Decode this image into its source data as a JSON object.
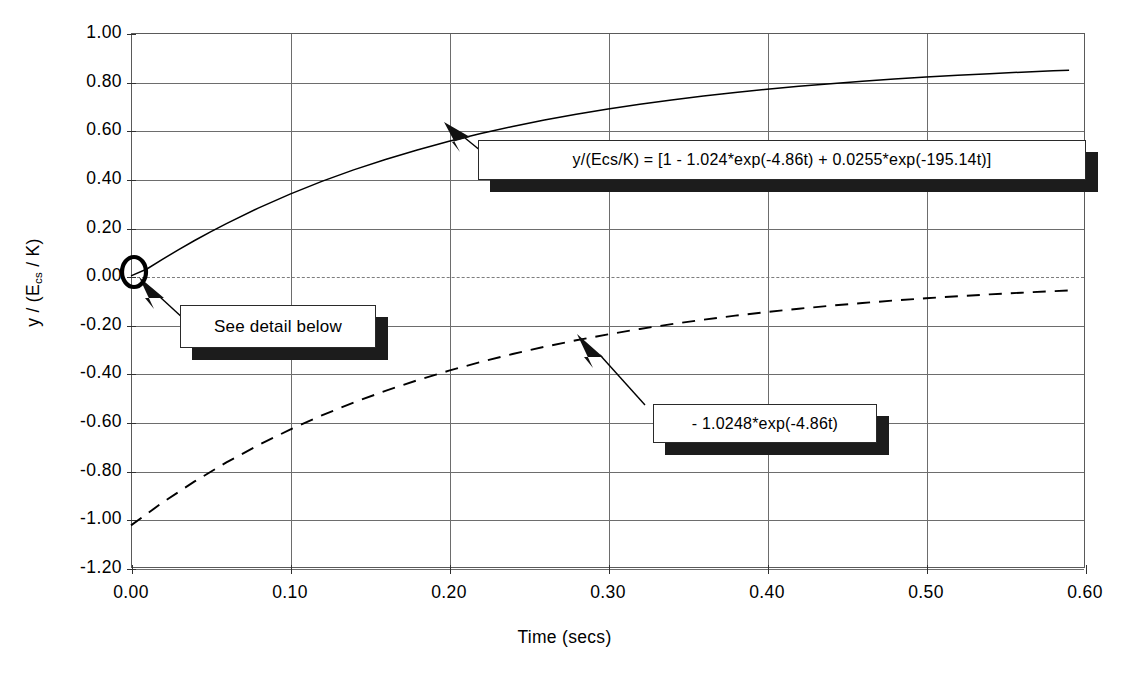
{
  "chart_data": {
    "type": "line",
    "title": "",
    "xlabel": "Time (secs)",
    "ylabel": "y / (Ecs / K)",
    "ylabel_parts": {
      "pre": "y / (E",
      "sub": "cs",
      "post": " / K)"
    },
    "xlim": [
      0.0,
      0.6
    ],
    "ylim": [
      -1.2,
      1.0
    ],
    "xticks": [
      "0.00",
      "0.10",
      "0.20",
      "0.30",
      "0.40",
      "0.50",
      "0.60"
    ],
    "xtick_values": [
      0.0,
      0.1,
      0.2,
      0.3,
      0.4,
      0.5,
      0.6
    ],
    "yticks": [
      "1.00",
      "0.80",
      "0.60",
      "0.40",
      "0.20",
      "0.00",
      "-0.20",
      "-0.40",
      "-0.60",
      "-0.80",
      "-1.00",
      "-1.20"
    ],
    "ytick_values": [
      1.0,
      0.8,
      0.6,
      0.4,
      0.2,
      0.0,
      -0.2,
      -0.4,
      -0.6,
      -0.8,
      -1.0,
      -1.2
    ],
    "grid": {
      "horizontal": true,
      "vertical": true,
      "zero_line_dashed": true
    },
    "legend_position": "none",
    "series": [
      {
        "name": "total step response",
        "style": "solid",
        "color": "#000000",
        "formula": "1 - 1.024*exp(-4.86*t) + 0.0255*exp(-195.14*t)",
        "x": [
          0.0,
          0.01,
          0.02,
          0.03,
          0.04,
          0.05,
          0.06,
          0.08,
          0.1,
          0.12,
          0.14,
          0.16,
          0.18,
          0.2,
          0.22,
          0.24,
          0.26,
          0.28,
          0.3,
          0.32,
          0.34,
          0.36,
          0.38,
          0.4,
          0.42,
          0.44,
          0.46,
          0.48,
          0.5,
          0.52,
          0.54,
          0.56,
          0.58,
          0.59
        ],
        "y": [
          0.0015,
          0.0296,
          0.0701,
          0.1093,
          0.1467,
          0.1824,
          0.2163,
          0.2798,
          0.3374,
          0.3897,
          0.4371,
          0.4801,
          0.5191,
          0.5545,
          0.5865,
          0.6156,
          0.6419,
          0.6658,
          0.6875,
          0.7071,
          0.7249,
          0.741,
          0.7556,
          0.7689,
          0.7809,
          0.7918,
          0.8017,
          0.8106,
          0.8188,
          0.8261,
          0.8328,
          0.8389,
          0.8444,
          0.8469
        ]
      },
      {
        "name": "dominant exponential term",
        "style": "dashed",
        "color": "#000000",
        "formula": "-1.0248*exp(-4.86*t)",
        "x": [
          0.0,
          0.02,
          0.04,
          0.06,
          0.08,
          0.1,
          0.12,
          0.14,
          0.16,
          0.18,
          0.2,
          0.22,
          0.24,
          0.26,
          0.28,
          0.3,
          0.32,
          0.34,
          0.36,
          0.38,
          0.4,
          0.42,
          0.44,
          0.46,
          0.48,
          0.5,
          0.52,
          0.54,
          0.56,
          0.58,
          0.59
        ],
        "y": [
          -1.0248,
          -0.93,
          -0.844,
          -0.7659,
          -0.6951,
          -0.6308,
          -0.5725,
          -0.5196,
          -0.4716,
          -0.428,
          -0.3885,
          -0.3526,
          -0.32,
          -0.2904,
          -0.2636,
          -0.2393,
          -0.2171,
          -0.1971,
          -0.1789,
          -0.1624,
          -0.1474,
          -0.1337,
          -0.1214,
          -0.1102,
          -0.1,
          -0.0908,
          -0.0824,
          -0.0748,
          -0.0679,
          -0.0616,
          -0.0587
        ]
      }
    ],
    "annotations": [
      {
        "id": "eq1",
        "text": "y/(Ecs/K)  =  [1  -  1.024*exp(-4.86t)  +  0.0255*exp(-195.14t)]",
        "points_to": {
          "x": 0.2,
          "y": 0.5545
        }
      },
      {
        "id": "eq2",
        "text": "-  1.0248*exp(-4.86t)",
        "points_to": {
          "x": 0.29,
          "y": -0.245
        }
      },
      {
        "id": "detail",
        "text": "See  detail  below",
        "points_to": {
          "x": 0.003,
          "y": -0.01
        }
      }
    ],
    "markers": [
      {
        "id": "origin-highlight",
        "shape": "ellipse-outline",
        "x": 0.0,
        "y": 0.0
      }
    ]
  }
}
